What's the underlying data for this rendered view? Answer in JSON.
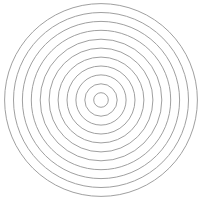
{
  "canvas": {
    "width": 201,
    "height": 199,
    "background": "#ffffff"
  },
  "figure": {
    "type": "concentric-circles",
    "ring_count": 11,
    "center": {
      "x": 101,
      "y": 100
    },
    "radii": [
      7.3,
      16.2,
      25.1,
      34.0,
      42.9,
      51.9,
      60.8,
      69.7,
      78.6,
      87.5,
      96.4
    ],
    "stroke_color": "#a0a0a0",
    "stroke_width": 1,
    "fill": "none"
  }
}
